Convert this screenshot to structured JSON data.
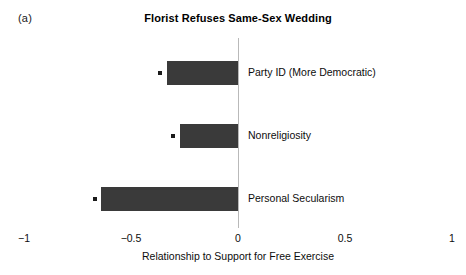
{
  "panel": {
    "label": "(a)"
  },
  "chart_data": {
    "type": "bar",
    "orientation": "horizontal",
    "title": "Florist Refuses Same-Sex Wedding",
    "xlabel": "Relationship to Support for Free Exercise",
    "ylabel": "",
    "xlim": [
      -1,
      1
    ],
    "xticks": [
      -1,
      -0.5,
      0,
      0.5,
      1
    ],
    "xticklabels": [
      "−1",
      "−0.5",
      "0",
      "0.5",
      "1"
    ],
    "grid": false,
    "legend": null,
    "zero_reference_line": 0,
    "categories": [
      "Party ID (More Democratic)",
      "Nonreligiosity",
      "Personal Secularism"
    ],
    "values": [
      -0.33,
      -0.27,
      -0.64
    ],
    "point_markers": [
      -0.365,
      -0.305,
      -0.67
    ],
    "bar_color": "#3a3a3a",
    "marker_color": "#1b1b1b",
    "zero_line_color": "#b9b9b9"
  }
}
